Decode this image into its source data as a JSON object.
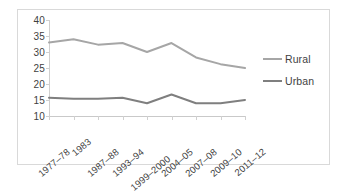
{
  "chart_data": {
    "type": "line",
    "title": "",
    "xlabel": "",
    "ylabel": "",
    "ylim": [
      10,
      40
    ],
    "yticks": [
      10,
      15,
      20,
      25,
      30,
      35,
      40
    ],
    "grid": false,
    "legend_position": "right",
    "categories": [
      "1977–78",
      "1983",
      "1987–88",
      "1993–94",
      "1999–2000",
      "2004–05",
      "2007–08",
      "2009–10",
      "2011–12"
    ],
    "series": [
      {
        "name": "Rural",
        "color": "#a6a6a6",
        "values": [
          33.0,
          34.0,
          32.3,
          32.8,
          30.0,
          32.8,
          28.3,
          26.2,
          25.0
        ]
      },
      {
        "name": "Urban",
        "color": "#7f7f7f",
        "values": [
          15.7,
          15.4,
          15.4,
          15.7,
          14.0,
          16.7,
          14.0,
          14.0,
          15.0
        ]
      }
    ]
  },
  "legend": {
    "items": [
      {
        "label": "Rural",
        "color": "#a6a6a6"
      },
      {
        "label": "Urban",
        "color": "#7f7f7f"
      }
    ]
  }
}
